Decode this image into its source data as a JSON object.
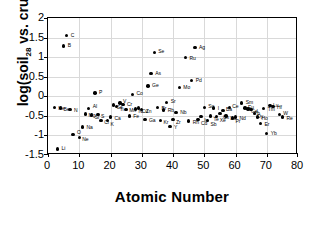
{
  "chart_data": {
    "type": "scatter",
    "title": "",
    "xlabel": "Atomic Number",
    "ylabel": "log(soil28 vs. crust28)",
    "ylabel_parts": {
      "prefix": "log(soil",
      "sub1": "28",
      "mid": " vs. crust",
      "sub2": "28",
      "suffix": ")"
    },
    "xlim": [
      0,
      80
    ],
    "ylim": [
      -1.5,
      2
    ],
    "xticks": [
      0,
      10,
      20,
      30,
      40,
      50,
      60,
      70,
      80
    ],
    "yticks": [
      -1.5,
      -1,
      -0.5,
      0,
      0.5,
      1,
      1.5,
      2
    ],
    "xtick_labels": [
      "0",
      "10",
      "20",
      "30",
      "40",
      "50",
      "60",
      "70",
      "80"
    ],
    "ytick_labels": [
      "-1.5",
      "-1",
      "-0.5",
      "0",
      "0.5",
      "1",
      "1.5",
      "2"
    ],
    "grid": true,
    "legend": "none",
    "marker": "filled-circle-black",
    "points": [
      {
        "label": "Li",
        "x": 3,
        "y": -1.35,
        "lx": 4,
        "ly": -3
      },
      {
        "label": "B",
        "x": 5,
        "y": 1.28,
        "lx": 4,
        "ly": -3
      },
      {
        "label": "C",
        "x": 6,
        "y": 1.55,
        "lx": 4,
        "ly": -3
      },
      {
        "label": "N",
        "x": 7,
        "y": -0.33,
        "lx": 4,
        "ly": -1
      },
      {
        "label": "O",
        "x": 8,
        "y": -0.97,
        "lx": 4,
        "ly": -4
      },
      {
        "label": "Ne",
        "x": 10,
        "y": -1.05,
        "lx": 3,
        "ly": 0
      },
      {
        "label": "Na",
        "x": 11,
        "y": -0.78,
        "lx": 4,
        "ly": -2
      },
      {
        "label": "Mg",
        "x": 12,
        "y": -0.45,
        "lx": 3,
        "ly": -1
      },
      {
        "label": "Al",
        "x": 13,
        "y": -0.31,
        "lx": 4,
        "ly": -4
      },
      {
        "label": "Si",
        "x": 14,
        "y": -0.48,
        "lx": 3,
        "ly": 0
      },
      {
        "label": "S",
        "x": 16,
        "y": -0.47,
        "lx": 3,
        "ly": -1
      },
      {
        "label": "P",
        "x": 15,
        "y": 0.08,
        "lx": 4,
        "ly": -3
      },
      {
        "label": "Cl",
        "x": 17,
        "y": -0.62,
        "lx": 3,
        "ly": -1
      },
      {
        "label": "K",
        "x": 19,
        "y": -0.62,
        "lx": 3,
        "ly": 1
      },
      {
        "label": "Ca",
        "x": 20,
        "y": -0.53,
        "lx": 4,
        "ly": -1
      },
      {
        "label": "Sc",
        "x": 21,
        "y": -0.22,
        "lx": 3,
        "ly": 0
      },
      {
        "label": "Ti",
        "x": 22,
        "y": -0.26,
        "lx": 3,
        "ly": 1
      },
      {
        "label": "V",
        "x": 23,
        "y": -0.17,
        "lx": 3,
        "ly": -4
      },
      {
        "label": "Cr",
        "x": 24,
        "y": -0.21,
        "lx": 4,
        "ly": -3
      },
      {
        "label": "Mn",
        "x": 25,
        "y": -0.33,
        "lx": 3,
        "ly": -1
      },
      {
        "label": "Fe",
        "x": 26,
        "y": -0.5,
        "lx": 4,
        "ly": -2
      },
      {
        "label": "Co",
        "x": 27,
        "y": 0.05,
        "lx": 4,
        "ly": -3
      },
      {
        "label": "Ni",
        "x": 28,
        "y": -0.32,
        "lx": 3,
        "ly": 0
      },
      {
        "label": "Cu",
        "x": 29,
        "y": -0.3,
        "lx": 3,
        "ly": 1
      },
      {
        "label": "Zn",
        "x": 30,
        "y": -0.33,
        "lx": 4,
        "ly": 0
      },
      {
        "label": "Ga",
        "x": 31,
        "y": -0.6,
        "lx": 4,
        "ly": -2
      },
      {
        "label": "Ge",
        "x": 32,
        "y": 0.26,
        "lx": 4,
        "ly": -3
      },
      {
        "label": "As",
        "x": 33,
        "y": 0.58,
        "lx": 4,
        "ly": -3
      },
      {
        "label": "Se",
        "x": 34,
        "y": 1.12,
        "lx": 4,
        "ly": -3
      },
      {
        "label": "Br",
        "x": 35,
        "y": -0.28,
        "lx": 4,
        "ly": -1
      },
      {
        "label": "Kr",
        "x": 36,
        "y": -0.62,
        "lx": 3,
        "ly": -1
      },
      {
        "label": "Rb",
        "x": 37,
        "y": -0.35,
        "lx": 4,
        "ly": -2
      },
      {
        "label": "Sr",
        "x": 38,
        "y": -0.16,
        "lx": 4,
        "ly": -4
      },
      {
        "label": "Y",
        "x": 39,
        "y": -0.77,
        "lx": 4,
        "ly": -1
      },
      {
        "label": "Zr",
        "x": 40,
        "y": -0.6,
        "lx": 3,
        "ly": 0
      },
      {
        "label": "Nb",
        "x": 41,
        "y": -0.42,
        "lx": 4,
        "ly": -3
      },
      {
        "label": "Mo",
        "x": 42,
        "y": 0.22,
        "lx": 4,
        "ly": -3
      },
      {
        "label": "Ru",
        "x": 44,
        "y": 0.99,
        "lx": 4,
        "ly": -2
      },
      {
        "label": "Rh",
        "x": 45,
        "y": -0.63,
        "lx": 4,
        "ly": -1
      },
      {
        "label": "Pd",
        "x": 46,
        "y": 0.4,
        "lx": 4,
        "ly": -3
      },
      {
        "label": "Ag",
        "x": 47,
        "y": 1.24,
        "lx": 4,
        "ly": -3
      },
      {
        "label": "Cd",
        "x": 48,
        "y": -0.6,
        "lx": 3,
        "ly": 1
      },
      {
        "label": "In",
        "x": 49,
        "y": -0.52,
        "lx": 3,
        "ly": 1
      },
      {
        "label": "Sn",
        "x": 50,
        "y": -0.28,
        "lx": 4,
        "ly": -3
      },
      {
        "label": "Sb",
        "x": 51,
        "y": -0.62,
        "lx": 3,
        "ly": 1
      },
      {
        "label": "Te",
        "x": 52,
        "y": -0.5,
        "lx": 3,
        "ly": 1
      },
      {
        "label": "I",
        "x": 53,
        "y": -0.3,
        "lx": 4,
        "ly": -2
      },
      {
        "label": "Xe",
        "x": 54,
        "y": -0.52,
        "lx": 3,
        "ly": 1
      },
      {
        "label": "Cs",
        "x": 55,
        "y": -0.44,
        "lx": 3,
        "ly": 1
      },
      {
        "label": "Ba",
        "x": 56,
        "y": -0.36,
        "lx": 3,
        "ly": -3
      },
      {
        "label": "La",
        "x": 57,
        "y": -0.5,
        "lx": 4,
        "ly": 0
      },
      {
        "label": "Ce",
        "x": 58,
        "y": -0.28,
        "lx": 3,
        "ly": -3
      },
      {
        "label": "Pr",
        "x": 59,
        "y": -0.55,
        "lx": 3,
        "ly": 1
      },
      {
        "label": "Nd",
        "x": 60,
        "y": -0.53,
        "lx": 4,
        "ly": -1
      },
      {
        "label": "Sm",
        "x": 62,
        "y": -0.17,
        "lx": 4,
        "ly": -3
      },
      {
        "label": "Eu",
        "x": 63,
        "y": -0.3,
        "lx": 3,
        "ly": -3
      },
      {
        "label": "Gd",
        "x": 64,
        "y": -0.32,
        "lx": 3,
        "ly": 0
      },
      {
        "label": "Tb",
        "x": 65,
        "y": -0.34,
        "lx": 3,
        "ly": 1
      },
      {
        "label": "Dy",
        "x": 66,
        "y": -0.44,
        "lx": 3,
        "ly": 0
      },
      {
        "label": "Ho",
        "x": 67,
        "y": -0.53,
        "lx": 4,
        "ly": -1
      },
      {
        "label": "Er",
        "x": 68,
        "y": -0.69,
        "lx": 4,
        "ly": -1
      },
      {
        "label": "Tm",
        "x": 69,
        "y": -0.31,
        "lx": 4,
        "ly": -1
      },
      {
        "label": "Yb",
        "x": 70,
        "y": -0.95,
        "lx": 4,
        "ly": -2
      },
      {
        "label": "Lu",
        "x": 71,
        "y": -0.24,
        "lx": 3,
        "ly": -3
      },
      {
        "label": "Hf",
        "x": 72,
        "y": -0.26,
        "lx": 4,
        "ly": -1
      },
      {
        "label": "W",
        "x": 74,
        "y": -0.47,
        "lx": 4,
        "ly": -4
      },
      {
        "label": "Re",
        "x": 75,
        "y": -0.53,
        "lx": 4,
        "ly": -1
      },
      {
        "label": "He",
        "x": 2,
        "y": -0.29,
        "lx": 4,
        "ly": -2
      },
      {
        "label": "Be",
        "x": 4,
        "y": -0.3,
        "lx": 3,
        "ly": -1
      }
    ]
  }
}
